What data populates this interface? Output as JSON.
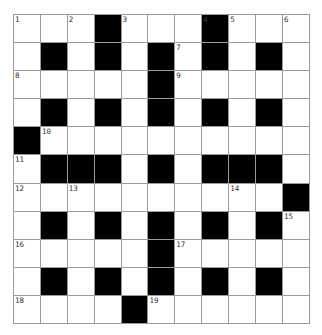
{
  "puzzle": {
    "rows": 11,
    "cols": 11,
    "layout": [
      "...#...#...",
      ".#.#.#.#.#.",
      ".....#.....",
      ".#.#.#.#.#.",
      "#..........",
      ".###.#.###.",
      "..........#",
      ".#.#.#.#.#.",
      ".....#.....",
      ".#.#.#.#.#.",
      "....#......"
    ],
    "numbers": [
      {
        "r": 0,
        "c": 0,
        "n": "1"
      },
      {
        "r": 0,
        "c": 2,
        "n": "2"
      },
      {
        "r": 0,
        "c": 4,
        "n": "3"
      },
      {
        "r": 0,
        "c": 7,
        "n": "4"
      },
      {
        "r": 0,
        "c": 8,
        "n": "5"
      },
      {
        "r": 0,
        "c": 10,
        "n": "6"
      },
      {
        "r": 1,
        "c": 6,
        "n": "7"
      },
      {
        "r": 2,
        "c": 0,
        "n": "8"
      },
      {
        "r": 2,
        "c": 6,
        "n": "9"
      },
      {
        "r": 4,
        "c": 1,
        "n": "10"
      },
      {
        "r": 5,
        "c": 0,
        "n": "11"
      },
      {
        "r": 6,
        "c": 0,
        "n": "12"
      },
      {
        "r": 6,
        "c": 2,
        "n": "13"
      },
      {
        "r": 6,
        "c": 8,
        "n": "14"
      },
      {
        "r": 7,
        "c": 10,
        "n": "15"
      },
      {
        "r": 8,
        "c": 0,
        "n": "16"
      },
      {
        "r": 8,
        "c": 6,
        "n": "17"
      },
      {
        "r": 10,
        "c": 0,
        "n": "18"
      },
      {
        "r": 10,
        "c": 5,
        "n": "19"
      }
    ],
    "colors": {
      "block": "#000000",
      "cell": "#ffffff",
      "gridline": "#9a9a9a"
    }
  }
}
